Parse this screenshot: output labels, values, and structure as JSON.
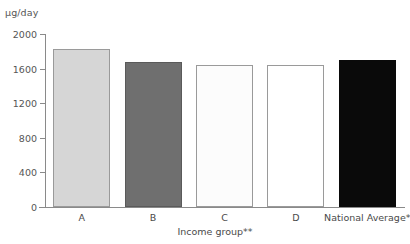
{
  "chart_data": {
    "type": "bar",
    "title": "",
    "subtitle": "",
    "categories": [
      "A",
      "B",
      "C",
      "D",
      "National Average*"
    ],
    "values": [
      1830,
      1680,
      1640,
      1640,
      1700
    ],
    "xlabel": "Income group**",
    "ylabel": "µg/day",
    "ylim": [
      0,
      2000
    ],
    "yticks": [
      0,
      400,
      800,
      1200,
      1600,
      2000
    ],
    "ytick_labels": [
      "0",
      "400",
      "800",
      "1200",
      "1600",
      "2000"
    ],
    "grid": false,
    "legend": "none",
    "bar_colors": [
      "#d6d6d6",
      "#6f6f6f",
      "#fcfcfc",
      "#ffffff",
      "#0a0a0a"
    ],
    "bar_border_colors": [
      "#9a9a9a",
      "#5a5a5a",
      "#9a9a9a",
      "#9a9a9a",
      "#0a0a0a"
    ],
    "axis_color": "#8a8a8a",
    "text_color": "#4a4a4a",
    "background": "#ffffff"
  }
}
